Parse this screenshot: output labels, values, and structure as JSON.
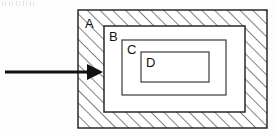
{
  "figure": {
    "background_color": "#fdfdfd",
    "stroke_color": "#1a1a1a",
    "fill_color": "#ffffff",
    "hatch_color": "#4a4a4a"
  },
  "regions": [
    {
      "id": "A",
      "label": "A",
      "fill": "hatched",
      "x": 78,
      "y": 10,
      "width": 189,
      "height": 118,
      "label_x": 85,
      "label_y": 28
    },
    {
      "id": "B",
      "label": "B",
      "fill": "white",
      "x": 104,
      "y": 26,
      "width": 141,
      "height": 86,
      "label_x": 109,
      "label_y": 41
    },
    {
      "id": "C",
      "label": "C",
      "fill": "white",
      "x": 122,
      "y": 40,
      "width": 104,
      "height": 55,
      "label_x": 127,
      "label_y": 54
    },
    {
      "id": "D",
      "label": "D",
      "fill": "white",
      "x": 141,
      "y": 52,
      "width": 68,
      "height": 30,
      "label_x": 146,
      "label_y": 67
    }
  ],
  "arrow": {
    "name": "input-arrow",
    "direction": "right",
    "shaft_start_x": 5,
    "shaft_end_x": 90,
    "shaft_y": 72,
    "shaft_thickness": 3,
    "head_tip_x": 103,
    "head_tip_y": 72,
    "head_back_x": 87,
    "head_half_height": 8,
    "color": "#111111"
  }
}
